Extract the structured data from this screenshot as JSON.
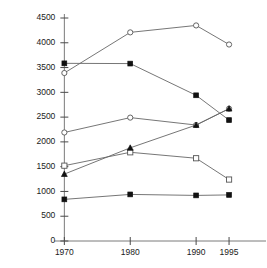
{
  "chart_data": {
    "type": "line",
    "title": "",
    "subtitle": "",
    "xlabel": "",
    "ylabel": "",
    "x": [
      1970,
      1980,
      1990,
      1995
    ],
    "categories": [
      "1970",
      "1980",
      "1990",
      "1995"
    ],
    "xtick_labels": [
      "1970",
      "1980",
      "1990",
      "1995"
    ],
    "ytick_labels": [
      "0",
      "500",
      "1000",
      "1500",
      "2000",
      "2500",
      "3000",
      "3500",
      "4000",
      "4500"
    ],
    "ytick_values": [
      0,
      500,
      1000,
      1500,
      2000,
      2500,
      3000,
      3500,
      4000,
      4500
    ],
    "ylim": [
      0,
      4500
    ],
    "xlim": [
      1966,
      2000
    ],
    "grid": false,
    "legend": "none",
    "x_axis_scale": "time-irregular",
    "series": [
      {
        "name": "series-1",
        "marker": "open-circle",
        "values": [
          3390,
          4210,
          4350,
          3965
        ]
      },
      {
        "name": "series-2",
        "marker": "filled-square",
        "values": [
          3585,
          3580,
          2940,
          2440
        ]
      },
      {
        "name": "series-3",
        "marker": "open-circle",
        "values": [
          2190,
          2490,
          2340,
          2670
        ]
      },
      {
        "name": "series-4",
        "marker": "open-square",
        "values": [
          1520,
          1790,
          1670,
          1240
        ]
      },
      {
        "name": "series-5",
        "marker": "filled-triangle",
        "values": [
          1350,
          1880,
          2340,
          2670
        ]
      },
      {
        "name": "series-6",
        "marker": "filled-square",
        "values": [
          840,
          940,
          920,
          930
        ]
      }
    ],
    "colors": {
      "axis": "#7a7a7a",
      "line": "#666666",
      "marker_filled": "#111111",
      "marker_open_fill": "#ffffff",
      "marker_open_stroke": "#555555",
      "text": "#1a1a1a",
      "background": "#ffffff"
    }
  }
}
